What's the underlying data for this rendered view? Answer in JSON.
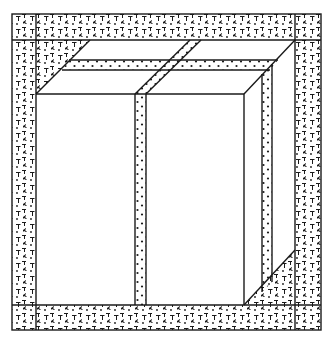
{
  "diagram": {
    "type": "technical-illustration",
    "colors": {
      "background": "#ffffff",
      "line": "#1a1a1a",
      "texture": "#1a1a1a"
    },
    "regions": [
      {
        "name": "outer-frame-padding",
        "fill": "textured-glyphs"
      },
      {
        "name": "box-front-face",
        "fill": "none"
      },
      {
        "name": "box-top-face",
        "fill": "none"
      },
      {
        "name": "box-right-face",
        "fill": "none"
      },
      {
        "name": "tape-strip",
        "fill": "dots"
      }
    ]
  }
}
